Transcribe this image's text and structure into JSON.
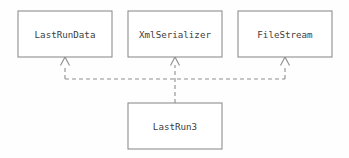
{
  "diagram": {
    "type": "uml-class-diagram",
    "notation": "realization",
    "background_color": "#fefefe",
    "stroke_color": "#8e8e8e",
    "text_color": "#3c3c3c",
    "classes": [
      {
        "id": "last-run-data",
        "label": "LastRunData",
        "row": "top",
        "x": 18,
        "y": 11,
        "width": 94,
        "height": 46,
        "center_x": 65
      },
      {
        "id": "xml-serializer",
        "label": "XmlSerializer",
        "row": "top",
        "x": 128,
        "y": 11,
        "width": 94,
        "height": 46,
        "center_x": 175
      },
      {
        "id": "file-stream",
        "label": "FileStream",
        "row": "top",
        "x": 238,
        "y": 11,
        "width": 94,
        "height": 46,
        "center_x": 285
      },
      {
        "id": "last-run-3",
        "label": "LastRun3",
        "row": "bottom",
        "x": 128,
        "y": 103,
        "width": 94,
        "height": 46,
        "center_x": 175
      }
    ],
    "relationships": [
      {
        "id": "rel-lastrun3-lastrundata",
        "from": "last-run-3",
        "to": "last-run-data",
        "kind": "realization",
        "line_style": "dashed",
        "arrowhead": "hollow-triangle"
      },
      {
        "id": "rel-lastrun3-xmlserializer",
        "from": "last-run-3",
        "to": "xml-serializer",
        "kind": "realization",
        "line_style": "dashed",
        "arrowhead": "hollow-triangle"
      },
      {
        "id": "rel-lastrun3-filestream",
        "from": "last-run-3",
        "to": "file-stream",
        "kind": "realization",
        "line_style": "dashed",
        "arrowhead": "hollow-triangle"
      }
    ]
  }
}
